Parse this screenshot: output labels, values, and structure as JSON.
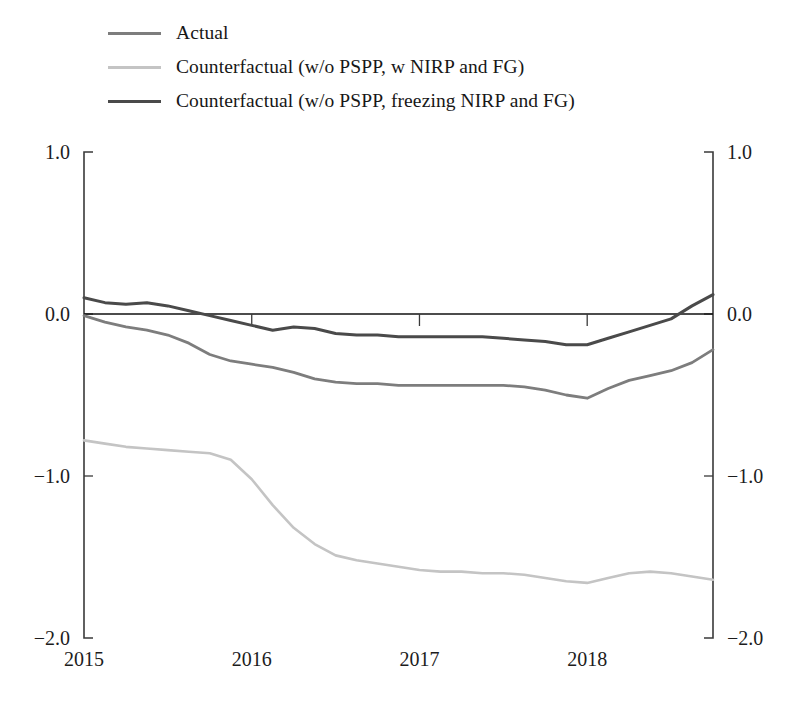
{
  "legend": {
    "position": "top-left",
    "items": [
      {
        "label": "Actual",
        "color": "#7d7d7d",
        "width": 3.0
      },
      {
        "label": "Counterfactual (w/o PSPP, w NIRP and FG)",
        "color": "#c4c4c4",
        "width": 3.0
      },
      {
        "label": "Counterfactual (w/o PSPP, freezing NIRP and FG)",
        "color": "#4a4a4a",
        "width": 3.2
      }
    ]
  },
  "axes": {
    "y_ticks": [
      "1.0",
      "0.0",
      "-1.0",
      "-2.0"
    ],
    "y_tick_values": [
      1.0,
      0.0,
      -1.0,
      -2.0
    ],
    "x_ticks": [
      "2015",
      "2016",
      "2017",
      "2018"
    ],
    "x_tick_values": [
      2015,
      2016,
      2017,
      2018
    ],
    "y_left_labels": [
      "1.0",
      "0.0",
      "-1.0",
      "-2.0"
    ],
    "y_right_labels": [
      "1.0",
      "0.0",
      "-1.0",
      "-2.0"
    ]
  },
  "chart_data": {
    "type": "line",
    "title": "",
    "subtitle": "",
    "xlabel": "",
    "ylabel": "",
    "xlim": [
      2015.0,
      2018.75
    ],
    "ylim": [
      -2.0,
      1.0
    ],
    "grid": false,
    "legend_position": "top-left",
    "x_tick_labels": [
      "2015",
      "2016",
      "2017",
      "2018"
    ],
    "y_tick_labels": [
      "1.0",
      "0.0",
      "-1.0",
      "-2.0"
    ],
    "x": [
      2015.0,
      2015.125,
      2015.25,
      2015.375,
      2015.5,
      2015.625,
      2015.75,
      2015.875,
      2016.0,
      2016.125,
      2016.25,
      2016.375,
      2016.5,
      2016.625,
      2016.75,
      2016.875,
      2017.0,
      2017.125,
      2017.25,
      2017.375,
      2017.5,
      2017.625,
      2017.75,
      2017.875,
      2018.0,
      2018.125,
      2018.25,
      2018.375,
      2018.5,
      2018.625,
      2018.75
    ],
    "series": [
      {
        "name": "Actual",
        "color": "#7d7d7d",
        "values": [
          -0.01,
          -0.05,
          -0.08,
          -0.1,
          -0.13,
          -0.18,
          -0.25,
          -0.29,
          -0.31,
          -0.33,
          -0.36,
          -0.4,
          -0.42,
          -0.43,
          -0.43,
          -0.44,
          -0.44,
          -0.44,
          -0.44,
          -0.44,
          -0.44,
          -0.45,
          -0.47,
          -0.5,
          -0.52,
          -0.46,
          -0.41,
          -0.38,
          -0.35,
          -0.3,
          -0.22
        ]
      },
      {
        "name": "Counterfactual (w/o PSPP, w NIRP and FG)",
        "color": "#c4c4c4",
        "values": [
          -0.78,
          -0.8,
          -0.82,
          -0.83,
          -0.84,
          -0.85,
          -0.86,
          -0.9,
          -1.02,
          -1.18,
          -1.32,
          -1.42,
          -1.49,
          -1.52,
          -1.54,
          -1.56,
          -1.58,
          -1.59,
          -1.59,
          -1.6,
          -1.6,
          -1.61,
          -1.63,
          -1.65,
          -1.66,
          -1.63,
          -1.6,
          -1.59,
          -1.6,
          -1.62,
          -1.64
        ]
      },
      {
        "name": "Counterfactual (w/o PSPP, freezing NIRP and FG)",
        "color": "#4a4a4a",
        "values": [
          0.1,
          0.07,
          0.06,
          0.07,
          0.05,
          0.02,
          -0.01,
          -0.04,
          -0.07,
          -0.1,
          -0.08,
          -0.09,
          -0.12,
          -0.13,
          -0.13,
          -0.14,
          -0.14,
          -0.14,
          -0.14,
          -0.14,
          -0.15,
          -0.16,
          -0.17,
          -0.19,
          -0.19,
          -0.15,
          -0.11,
          -0.07,
          -0.03,
          0.05,
          0.12
        ]
      }
    ]
  },
  "geometry": {
    "plot_left": 84,
    "plot_right": 713,
    "plot_top": 152,
    "plot_bottom": 638
  }
}
